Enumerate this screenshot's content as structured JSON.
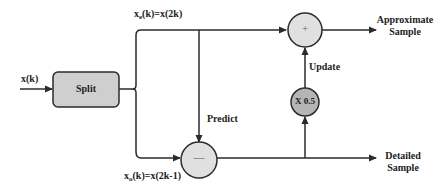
{
  "diagram": {
    "colors": {
      "stroke": "#2b2b2b",
      "split_fill": "#cfcfcf",
      "sum_fill": "#e0e0e0",
      "scale_fill": "#b5b5b5",
      "background": "#ffffff"
    },
    "input_label": "x(k)",
    "split_block": {
      "label": "Split"
    },
    "even_branch": {
      "label_prefix": "x",
      "label_sub": "e",
      "label_suffix": "(k)=x(2k)"
    },
    "odd_branch": {
      "label_prefix": "x",
      "label_sub": "o",
      "label_suffix": "(k)=x(2k-1)"
    },
    "add_node": {
      "symbol": "+"
    },
    "subtract_node": {
      "symbol": "—"
    },
    "scale_node": {
      "label": "X 0.5"
    },
    "predict_label": "Predict",
    "update_label": "Update",
    "outputs": {
      "approximate": {
        "line1": "Approximate",
        "line2": "Sample"
      },
      "detailed": {
        "line1": "Detailed",
        "line2": "Sample"
      }
    }
  }
}
